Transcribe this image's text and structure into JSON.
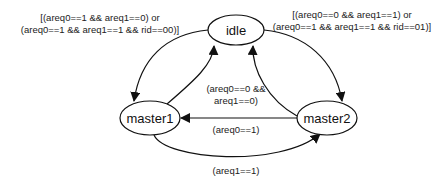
{
  "diagram": {
    "type": "state-machine",
    "states": [
      {
        "id": "idle",
        "label": "idle"
      },
      {
        "id": "master1",
        "label": "master1"
      },
      {
        "id": "master2",
        "label": "master2"
      }
    ],
    "transitions": [
      {
        "id": "idle-to-master1",
        "from": "idle",
        "to": "master1",
        "label_lines": [
          "[(areq0==1 && areq1==0) or",
          "(areq0==1 && areq1==1 && rid==00)]"
        ]
      },
      {
        "id": "idle-to-master2",
        "from": "idle",
        "to": "master2",
        "label_lines": [
          "[(areq0==0 && areq1==1) or",
          "(areq0==1 && areq1==1 && rid==01)]"
        ]
      },
      {
        "id": "master1-to-idle",
        "from": "master1",
        "to": "idle",
        "label_lines": [
          "(areq0==0 &&",
          "areq1==0)"
        ]
      },
      {
        "id": "master2-to-idle",
        "from": "master2",
        "to": "idle",
        "label_lines": []
      },
      {
        "id": "master2-to-master1",
        "from": "master2",
        "to": "master1",
        "label_lines": [
          "(areq0==1)"
        ]
      },
      {
        "id": "master1-to-master2",
        "from": "master1",
        "to": "master2",
        "label_lines": [
          "(areq1==1)"
        ]
      }
    ]
  }
}
